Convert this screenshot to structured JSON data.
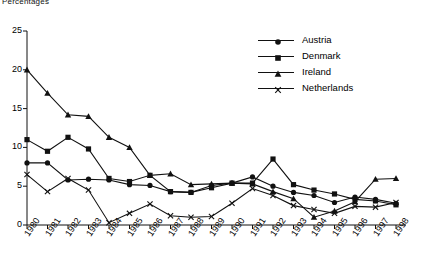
{
  "chart_data": {
    "type": "line",
    "title": "Percentages",
    "xlabel": "",
    "ylabel": "",
    "ylim": [
      0,
      25
    ],
    "yticks": [
      0,
      5,
      10,
      15,
      20,
      25
    ],
    "grid": false,
    "legend_position": "upper-right",
    "categories": [
      "1980",
      "1981",
      "1982",
      "1983",
      "1984",
      "1985",
      "1986",
      "1987",
      "1988",
      "1989",
      "1990",
      "1991",
      "1992",
      "1993",
      "1994",
      "1995",
      "1996",
      "1997",
      "1998"
    ],
    "series": [
      {
        "name": "Austria",
        "marker": "circle",
        "values": [
          8.0,
          8.0,
          5.8,
          5.9,
          5.8,
          5.2,
          5.1,
          4.3,
          4.2,
          5.1,
          5.4,
          6.2,
          5.0,
          4.2,
          3.8,
          2.9,
          3.6,
          3.3,
          2.8
        ]
      },
      {
        "name": "Denmark",
        "marker": "square",
        "values": [
          11.0,
          9.5,
          11.3,
          9.8,
          6.0,
          5.6,
          6.4,
          4.3,
          4.2,
          4.8,
          5.4,
          5.4,
          8.5,
          5.2,
          4.5,
          4.0,
          3.3,
          3.1,
          2.6
        ]
      },
      {
        "name": "Ireland",
        "marker": "triangle",
        "values": [
          20.0,
          17.0,
          14.2,
          14.0,
          11.3,
          10.0,
          6.4,
          6.6,
          5.2,
          5.3,
          5.4,
          5.3,
          4.3,
          3.4,
          1.0,
          1.8,
          3.0,
          5.9,
          6.0
        ]
      },
      {
        "name": "Netherlands",
        "marker": "cross",
        "values": [
          6.5,
          4.3,
          6.0,
          4.5,
          0.3,
          1.5,
          2.7,
          1.2,
          1.0,
          1.1,
          2.8,
          4.7,
          3.8,
          2.5,
          2.0,
          1.5,
          2.4,
          2.3,
          2.9
        ]
      }
    ]
  },
  "legend": {
    "items": [
      {
        "label": "Austria"
      },
      {
        "label": "Denmark"
      },
      {
        "label": "Ireland"
      },
      {
        "label": "Netherlands"
      }
    ]
  }
}
